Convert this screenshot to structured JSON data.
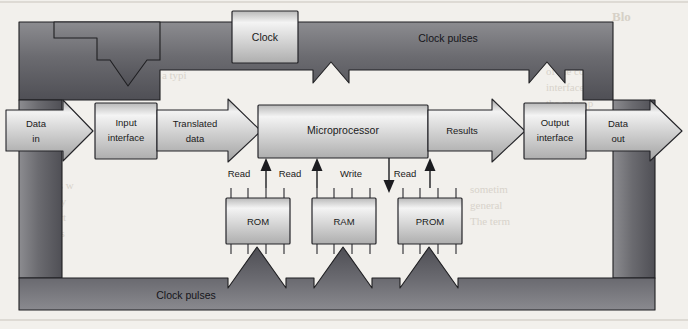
{
  "figure": {
    "type": "block-diagram",
    "background_color": "#f2f0ec",
    "outline_color": "#2a2a2a",
    "band_dark_color": "#5d5d62",
    "block_light_color": "#e8e8e8"
  },
  "blocks": {
    "clock": "Clock",
    "input_interface": "Input\ninterface",
    "input_interface_line1": "Input",
    "input_interface_line2": "interface",
    "microprocessor": "Microprocessor",
    "output_interface_line1": "Output",
    "output_interface_line2": "interface",
    "rom": "ROM",
    "ram": "RAM",
    "prom": "PROM"
  },
  "flow_arrows": {
    "data_in_line1": "Data",
    "data_in_line2": "in",
    "translated_line1": "Translated",
    "translated_line2": "data",
    "results": "Results",
    "data_out_line1": "Data",
    "data_out_line2": "out"
  },
  "bus_labels": {
    "clock_pulses_top": "Clock pulses",
    "clock_pulses_bottom": "Clock pulses"
  },
  "memory_signals": [
    {
      "label": "Read",
      "direction": "up",
      "target": "ROM"
    },
    {
      "label": "Read",
      "direction": "up",
      "target": "ROM"
    },
    {
      "label": "Write",
      "direction": "down",
      "target": "RAM"
    },
    {
      "label": "Read",
      "direction": "up",
      "target": "PROM"
    }
  ],
  "signal_labels": {
    "read_1": "Read",
    "read_2": "Read",
    "write": "Write",
    "read_3": "Read"
  },
  "page_bleed_text": {
    "right_heading": "Blo",
    "lines": [
      "The block",
      "for exampl",
      "of the com",
      "interface a",
      "the microp",
      "results ar",
      "to a form",
      "In a typi",
      "address w",
      "or many",
      "in a part",
      "Circuits",
      "sometim",
      "general",
      "The term"
    ]
  }
}
